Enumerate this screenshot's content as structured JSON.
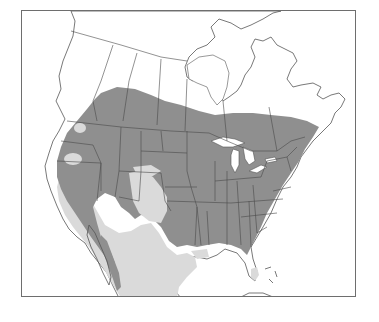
{
  "map": {
    "type": "species-range-map",
    "region": "North America",
    "text_labels": [],
    "legend": [],
    "colors": {
      "background": "#ffffff",
      "frame": "#6e6e6e",
      "main_range": "#8f8f8f",
      "marginal_range": "#dadada",
      "outside_range": "#ffffff",
      "boundary_lines": "#4a4a4a"
    },
    "zones": [
      {
        "id": "main-range",
        "description": "dark gray: southern Canada, most of contiguous US"
      },
      {
        "id": "marginal-range",
        "description": "light gray: desert southwest, southern Texas/Mexico, southern Florida tip, patches in Great Basin and plains"
      },
      {
        "id": "outside-range",
        "description": "white: northern Canada, Arctic, oceans"
      }
    ]
  }
}
